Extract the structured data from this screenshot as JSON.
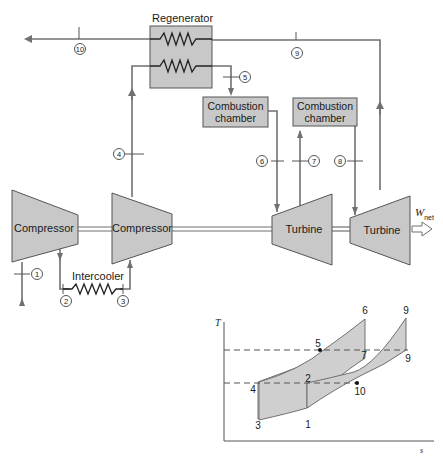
{
  "colors": {
    "component_fill": "#c8c8c8",
    "line": "#707070",
    "text": "#1a1a1a",
    "shade": "#cfcfcf"
  },
  "components": {
    "regenerator": "Regenerator",
    "combustion_chamber_1": [
      "Combustion",
      "chamber"
    ],
    "combustion_chamber_2": [
      "Combustion",
      "chamber"
    ],
    "compressor_1": "Compressor",
    "compressor_2": "Compressor",
    "turbine_1": "Turbine",
    "turbine_2": "Turbine",
    "intercooler": "Intercooler",
    "work_out": {
      "symbol": "W",
      "subscript": "net"
    }
  },
  "state_points": [
    "1",
    "2",
    "3",
    "4",
    "5",
    "6",
    "7",
    "8",
    "9",
    "10"
  ],
  "ts_diagram": {
    "y_axis_label": "T",
    "x_axis_label": "s",
    "point_labels": {
      "p1": "1",
      "p2": "2",
      "p3": "3",
      "p4": "4",
      "p5": "5",
      "p6": "6",
      "p7": "7",
      "p9_top": "9",
      "p9": "9",
      "p10": "10"
    }
  }
}
